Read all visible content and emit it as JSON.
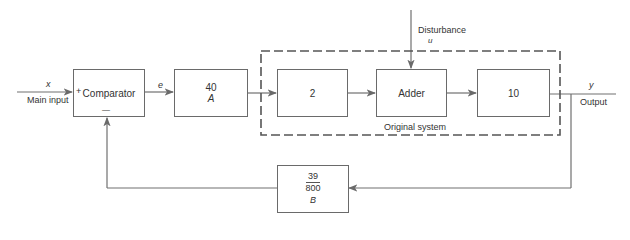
{
  "diagram": {
    "type": "block-diagram",
    "inputs": {
      "main_input": {
        "symbol": "x",
        "label": "Main input"
      },
      "disturbance": {
        "label": "Disturbance",
        "symbol": "u"
      }
    },
    "output": {
      "symbol": "y",
      "label": "Output"
    },
    "blocks": {
      "comparator": {
        "label": "Comparator",
        "plus_sign": "+",
        "minus_sign": "—"
      },
      "amplifier": {
        "gain": "40",
        "name": "A"
      },
      "gain2": {
        "gain": "2"
      },
      "adder": {
        "label": "Adder"
      },
      "gain10": {
        "gain": "10"
      },
      "feedback": {
        "numerator": "39",
        "denominator": "800",
        "name": "B"
      }
    },
    "signals": {
      "error": "e"
    },
    "group": {
      "label": "Original system"
    }
  }
}
